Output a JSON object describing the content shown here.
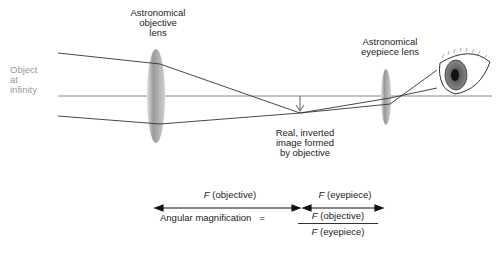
{
  "labels": {
    "objective_lens": "Astronomical objective lens",
    "objective_lens_lines": [
      "Astronomical",
      "objective",
      "lens"
    ],
    "eyepiece_lens_lines": [
      "Astronomical",
      "eyepiece lens"
    ],
    "object_lines": [
      "Object",
      "at",
      "infinity"
    ],
    "image_lines": [
      "Real, inverted",
      "image formed",
      "by objective"
    ]
  },
  "focal": {
    "objective_sym": "F",
    "objective_text": " (objective)",
    "eyepiece_sym": "F",
    "eyepiece_text": " (eyepiece)"
  },
  "formula": {
    "lhs": "Angular magnification",
    "equals": "=",
    "num_sym": "F",
    "num_text": " (objective)",
    "den_sym": "F",
    "den_text": " (eyepiece)"
  },
  "colors": {
    "lens": "#8a8a8a",
    "ray": "#333333",
    "axis": "#888888",
    "text_gray": "#999999"
  }
}
